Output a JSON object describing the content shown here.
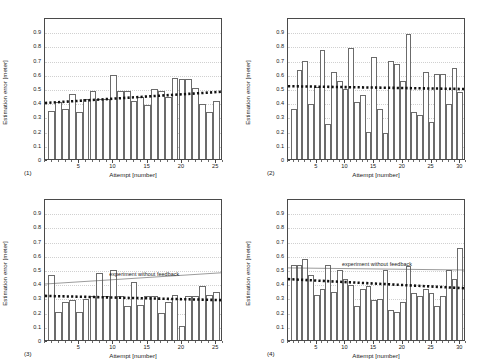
{
  "figure": {
    "axis_title_y": "Estimation error [meter]",
    "axis_title_x": "Attempt [number]",
    "ytick_labels": [
      "0",
      "0.1",
      "0.2",
      "0.3",
      "0.4",
      "0.5",
      "0.6",
      "0.7",
      "0.8",
      "0.9"
    ],
    "annotation_text": "experiment without feedback",
    "colors": {
      "bar_edge": "#6b6b6b",
      "bar_fill": "#ffffff",
      "trend": "#111111",
      "reference": "#555555",
      "axis": "#4a4a4a",
      "grid": "#d0d0d0",
      "background": "#ffffff"
    }
  },
  "chart_data": [
    {
      "type": "bar",
      "panel": "(1)",
      "title": "",
      "xlabel": "Attempt [number]",
      "ylabel": "Estimation error [meter]",
      "xlim": [
        0,
        26
      ],
      "ylim": [
        0,
        1.0
      ],
      "grid": true,
      "xticks": [
        5,
        10,
        15,
        20,
        25
      ],
      "yticks": [
        0,
        0.1,
        0.2,
        0.3,
        0.4,
        0.5,
        0.6,
        0.7,
        0.8,
        0.9
      ],
      "categories": [
        1,
        2,
        3,
        4,
        5,
        6,
        7,
        8,
        9,
        10,
        11,
        12,
        13,
        14,
        15,
        16,
        17,
        18,
        19,
        20,
        21,
        22,
        23,
        24,
        25
      ],
      "values": [
        0.34,
        0.4,
        0.35,
        0.46,
        0.33,
        0.42,
        0.48,
        0.42,
        0.42,
        0.59,
        0.48,
        0.48,
        0.41,
        0.44,
        0.38,
        0.49,
        0.48,
        0.44,
        0.57,
        0.56,
        0.56,
        0.5,
        0.39,
        0.33,
        0.41
      ],
      "trendline": {
        "label": "linear fit",
        "style": "dotted-thick",
        "y_start": 0.4,
        "y_end": 0.48
      },
      "reference_line": null,
      "annotations": []
    },
    {
      "type": "bar",
      "panel": "(2)",
      "title": "",
      "xlabel": "Attempt [number]",
      "ylabel": "Estimation error [meter]",
      "xlim": [
        0,
        31
      ],
      "ylim": [
        0,
        1.0
      ],
      "grid": true,
      "xticks": [
        5,
        10,
        15,
        20,
        25,
        30
      ],
      "yticks": [
        0,
        0.1,
        0.2,
        0.3,
        0.4,
        0.5,
        0.6,
        0.7,
        0.8,
        0.9
      ],
      "categories": [
        1,
        2,
        3,
        4,
        5,
        6,
        7,
        8,
        9,
        10,
        11,
        12,
        13,
        14,
        15,
        16,
        17,
        18,
        19,
        20,
        21,
        22,
        23,
        24,
        25,
        26,
        27,
        28,
        29,
        30
      ],
      "values": [
        0.35,
        0.63,
        0.69,
        0.39,
        0.51,
        0.77,
        0.25,
        0.61,
        0.55,
        0.49,
        0.78,
        0.4,
        0.45,
        0.19,
        0.72,
        0.35,
        0.18,
        0.69,
        0.67,
        0.55,
        0.88,
        0.33,
        0.31,
        0.61,
        0.26,
        0.6,
        0.6,
        0.39,
        0.64,
        0.47
      ],
      "trendline": {
        "label": "linear fit",
        "style": "dotted-thick",
        "y_start": 0.52,
        "y_end": 0.5
      },
      "reference_line": null,
      "annotations": []
    },
    {
      "type": "bar",
      "panel": "(3)",
      "title": "",
      "xlabel": "Attempt [number]",
      "ylabel": "Estimation error [meter]",
      "xlim": [
        0,
        26
      ],
      "ylim": [
        0,
        1.0
      ],
      "grid": true,
      "xticks": [
        5,
        10,
        15,
        20,
        25
      ],
      "yticks": [
        0,
        0.1,
        0.2,
        0.3,
        0.4,
        0.5,
        0.6,
        0.7,
        0.8,
        0.9
      ],
      "categories": [
        1,
        2,
        3,
        4,
        5,
        6,
        7,
        8,
        9,
        10,
        11,
        12,
        13,
        14,
        15,
        16,
        17,
        18,
        19,
        20,
        21,
        22,
        23,
        24,
        25
      ],
      "values": [
        0.46,
        0.2,
        0.27,
        0.28,
        0.2,
        0.29,
        0.31,
        0.47,
        0.31,
        0.49,
        0.31,
        0.24,
        0.41,
        0.25,
        0.31,
        0.31,
        0.19,
        0.27,
        0.32,
        0.1,
        0.31,
        0.31,
        0.38,
        0.32,
        0.34
      ],
      "trendline": {
        "label": "linear fit",
        "style": "dotted-thick",
        "y_start": 0.315,
        "y_end": 0.285
      },
      "reference_line": {
        "label": "experiment without feedback",
        "style": "thin-solid",
        "y_start": 0.4,
        "y_end": 0.48
      },
      "annotations": [
        {
          "text": "experiment without feedback",
          "x": 14.5,
          "y": 0.475
        }
      ]
    },
    {
      "type": "bar",
      "panel": "(4)",
      "title": "",
      "xlabel": "Attempt [number]",
      "ylabel": "Estimation error [meter]",
      "xlim": [
        0,
        31
      ],
      "ylim": [
        0,
        1.0
      ],
      "grid": true,
      "xticks": [
        5,
        10,
        15,
        20,
        25,
        30
      ],
      "yticks": [
        0,
        0.1,
        0.2,
        0.3,
        0.4,
        0.5,
        0.6,
        0.7,
        0.8,
        0.9
      ],
      "categories": [
        1,
        2,
        3,
        4,
        5,
        6,
        7,
        8,
        9,
        10,
        11,
        12,
        13,
        14,
        15,
        16,
        17,
        18,
        19,
        20,
        21,
        22,
        23,
        24,
        25,
        26,
        27,
        28,
        29,
        30
      ],
      "values": [
        0.53,
        0.53,
        0.57,
        0.46,
        0.32,
        0.36,
        0.53,
        0.34,
        0.49,
        0.43,
        0.39,
        0.24,
        0.36,
        0.38,
        0.28,
        0.29,
        0.49,
        0.21,
        0.2,
        0.27,
        0.52,
        0.33,
        0.31,
        0.36,
        0.33,
        0.24,
        0.31,
        0.49,
        0.43,
        0.65
      ],
      "trendline": {
        "label": "linear fit",
        "style": "dotted-thick",
        "y_start": 0.435,
        "y_end": 0.37
      },
      "reference_line": {
        "label": "experiment without feedback",
        "style": "thin-solid",
        "y_start": 0.515,
        "y_end": 0.5
      },
      "annotations": [
        {
          "text": "experiment without feedback",
          "x": 15.5,
          "y": 0.545
        }
      ]
    }
  ]
}
